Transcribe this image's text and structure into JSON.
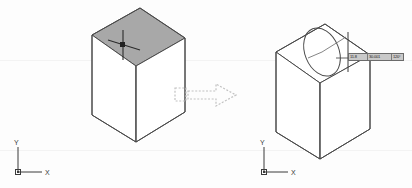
{
  "diagram": {
    "background_color": "#fdfdfd",
    "line_color": "#4a4a4a",
    "highlight_fill": "#a8a8a8",
    "arrow_color": "#c2c2c2"
  },
  "left_panel": {
    "name": "cube-with-selected-top-face",
    "cube": {
      "top_face_state": "selected",
      "top_face_fill": "#a8a8a8",
      "edge_color": "#4a4a4a"
    },
    "cursor": {
      "type": "crosshair-pickbox",
      "pick_box_color": "#222222"
    },
    "ucs_icon": {
      "name": "ucs-icon",
      "x_label": "X",
      "y_label": "Y",
      "origin_marker": "square"
    }
  },
  "transition": {
    "name": "transition-arrow",
    "style": "dashed-outline",
    "direction": "right",
    "tail_marker": "dashed-rectangle",
    "color": "#c2c2c2"
  },
  "right_panel": {
    "name": "cube-with-ellipse-in-progress",
    "cube": {
      "top_face_state": "unselected",
      "top_face_fill": "none",
      "edge_color": "#4a4a4a"
    },
    "ellipse": {
      "name": "ellipse-geometry",
      "state": "in-progress",
      "stroke": "#4a4a4a",
      "construction_lines": true
    },
    "cursor": {
      "type": "crosshair-pickbox",
      "pick_box_color": "#222222"
    },
    "dynamic_input": {
      "name": "dynamic-input-tooltip",
      "fields": [
        {
          "label": "11.8",
          "editable": true
        },
        {
          "label": "30.001",
          "editable": false
        },
        {
          "label": "120°",
          "editable": false
        }
      ]
    },
    "ucs_icon": {
      "name": "ucs-icon",
      "x_label": "X",
      "y_label": "Y",
      "origin_marker": "square"
    }
  }
}
